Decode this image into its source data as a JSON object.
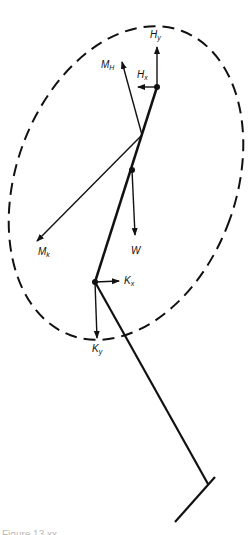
{
  "diagram": {
    "type": "free-body diagram",
    "boundary": "dashed ellipse enclosing thigh segment",
    "labels": {
      "Hy": {
        "main": "H",
        "sub": "y"
      },
      "Hx": {
        "main": "H",
        "sub": "x"
      },
      "MH": {
        "main": "M",
        "sub": "H"
      },
      "Mk": {
        "main": "M",
        "sub": "k"
      },
      "W": {
        "main": "W"
      },
      "Kx": {
        "main": "K",
        "sub": "x"
      },
      "Ky": {
        "main": "K",
        "sub": "y"
      }
    },
    "nodes": [
      "hip joint",
      "center of mass",
      "knee joint",
      "ankle/foot"
    ],
    "caption": "Figure 13.xx"
  }
}
